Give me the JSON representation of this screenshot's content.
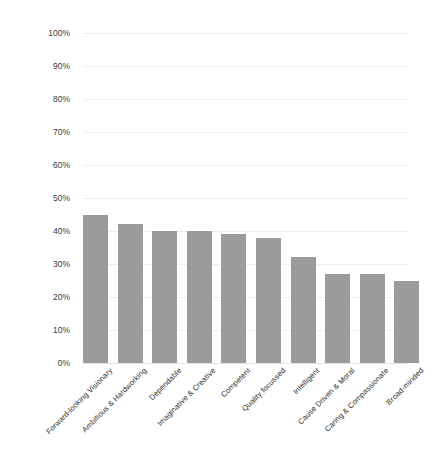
{
  "chart_data": {
    "type": "bar",
    "title": "",
    "subtitle": "",
    "xlabel": "",
    "ylabel": "",
    "ylim": [
      0,
      100
    ],
    "ytick_labels": [
      "0%",
      "10%",
      "20%",
      "30%",
      "40%",
      "50%",
      "60%",
      "70%",
      "80%",
      "90%",
      "100%"
    ],
    "ytick_values": [
      0,
      10,
      20,
      30,
      40,
      50,
      60,
      70,
      80,
      90,
      100
    ],
    "grid": "horizontal",
    "legend": "none",
    "bar_color": "#9b9b9b",
    "gridline_color": "#eeeeee",
    "background_color": "#ffffff",
    "categories": [
      "Forward-looking Visionary",
      "Ambitious & Hardworking",
      "Dependable",
      "Imaginative & Creative",
      "Competent",
      "Quality focussed",
      "Intelligent",
      "Cause Driven & Moral",
      "Caring & Compassionate",
      "Broad-minded"
    ],
    "values": [
      45,
      42,
      40,
      40,
      39,
      38,
      32,
      27,
      27,
      25
    ],
    "value_labels": [
      "45%",
      "42%",
      "40%",
      "40%",
      "39%",
      "38%",
      "32%",
      "27%",
      "27%",
      "25%"
    ]
  }
}
